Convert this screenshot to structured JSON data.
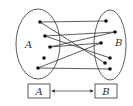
{
  "diagram": {
    "title": "",
    "set_a": {
      "label": "A",
      "ellipse": {
        "cx": 38,
        "cy": 44,
        "rx": 22,
        "ry": 35
      },
      "label_pos": {
        "x": 25,
        "y": 48
      },
      "points": [
        {
          "id": "a1",
          "x": 40,
          "y": 22
        },
        {
          "id": "a2",
          "x": 45,
          "y": 36
        },
        {
          "id": "a3",
          "x": 50,
          "y": 47
        },
        {
          "id": "a4",
          "x": 44,
          "y": 58
        },
        {
          "id": "a5",
          "x": 38,
          "y": 68
        }
      ]
    },
    "set_b": {
      "label": "B",
      "ellipse": {
        "cx": 110,
        "cy": 45,
        "rx": 16,
        "ry": 35
      },
      "label_pos": {
        "x": 115,
        "y": 46
      },
      "points": [
        {
          "id": "b1",
          "x": 106,
          "y": 21
        },
        {
          "id": "b2",
          "x": 115,
          "y": 32
        },
        {
          "id": "b3",
          "x": 101,
          "y": 43
        },
        {
          "id": "b4",
          "x": 110,
          "y": 58
        },
        {
          "id": "b5",
          "x": 105,
          "y": 63
        },
        {
          "id": "b6",
          "x": 110,
          "y": 69
        }
      ]
    },
    "mappings": [
      {
        "from": "a1",
        "to": "b1"
      },
      {
        "from": "a1",
        "to": "b5"
      },
      {
        "from": "a2",
        "to": "b2"
      },
      {
        "from": "a2",
        "to": "b4"
      },
      {
        "from": "a3",
        "to": "b3"
      },
      {
        "from": "a3",
        "to": "b2"
      },
      {
        "from": "a5",
        "to": "b3"
      },
      {
        "from": "a5",
        "to": "b6"
      }
    ],
    "bottom": {
      "box_a": {
        "label": "A",
        "x": 28,
        "y": 84,
        "w": 22,
        "h": 14
      },
      "box_b": {
        "label": "B",
        "x": 95,
        "y": 84,
        "w": 22,
        "h": 14
      },
      "arrow": "bidirectional"
    },
    "colors": {
      "stroke": "#333333",
      "dot": "#111111",
      "background": "#ffffff"
    }
  }
}
